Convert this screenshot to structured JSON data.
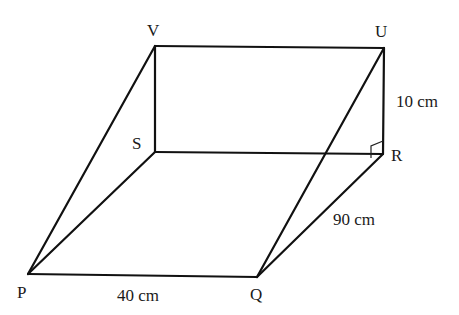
{
  "diagram": {
    "type": "prism",
    "vertices": {
      "V": {
        "label": "V",
        "x": 155,
        "y": 46
      },
      "U": {
        "label": "U",
        "x": 384,
        "y": 48
      },
      "S": {
        "label": "S",
        "x": 155,
        "y": 152
      },
      "R": {
        "label": "R",
        "x": 383,
        "y": 154
      },
      "P": {
        "label": "P",
        "x": 28,
        "y": 274
      },
      "Q": {
        "label": "Q",
        "x": 257,
        "y": 277
      }
    },
    "edges": [
      [
        "V",
        "U"
      ],
      [
        "V",
        "S"
      ],
      [
        "U",
        "R"
      ],
      [
        "S",
        "R"
      ],
      [
        "P",
        "Q"
      ],
      [
        "P",
        "S"
      ],
      [
        "Q",
        "R"
      ],
      [
        "P",
        "V"
      ],
      [
        "Q",
        "U"
      ]
    ],
    "labels": {
      "V": "V",
      "U": "U",
      "S": "S",
      "R": "R",
      "P": "P",
      "Q": "Q"
    },
    "measurements": {
      "PQ": "40 cm",
      "QR": "90 cm",
      "UR": "10 cm"
    },
    "right_angle_at": "R",
    "colors": {
      "line": "#111111",
      "text": "#1a1a1a",
      "background": "#ffffff"
    }
  }
}
